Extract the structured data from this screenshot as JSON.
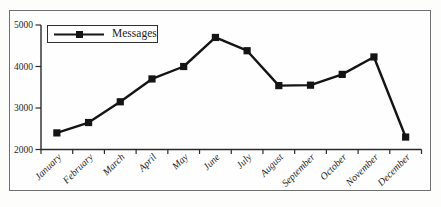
{
  "chart_data": {
    "type": "line",
    "title": "",
    "xlabel": "",
    "ylabel": "",
    "categories": [
      "January",
      "February",
      "March",
      "April",
      "May",
      "June",
      "July",
      "August",
      "September",
      "October",
      "November",
      "December"
    ],
    "series": [
      {
        "name": "Messages",
        "values": [
          2400,
          2650,
          3150,
          3700,
          4000,
          4700,
          4380,
          3540,
          3550,
          3810,
          4230,
          2300
        ],
        "marker": "square"
      }
    ],
    "ylim": [
      2000,
      5000
    ],
    "yticks": [
      2000,
      3000,
      4000,
      5000
    ],
    "grid": false,
    "legend": {
      "label": "Messages",
      "position": "top-left"
    }
  },
  "colors": {
    "line": "#141414",
    "marker": "#141414",
    "axis": "#2a2a2a",
    "text": "#1f1f1f",
    "frame_border": "#707070",
    "legend_border": "#2f2f2f",
    "background": "#fdfdfc",
    "plot_background": "#fefefe"
  }
}
